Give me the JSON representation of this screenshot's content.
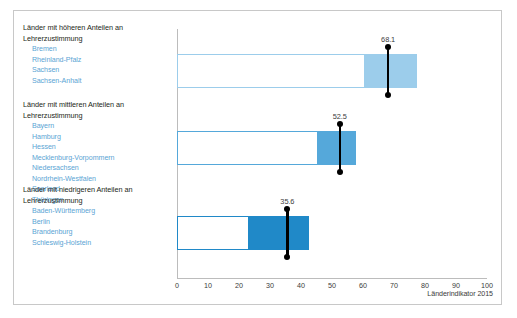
{
  "figure": {
    "source_note": "Länderindikator 2015"
  },
  "chart_data": {
    "type": "bar",
    "title": "",
    "xlabel": "",
    "ylabel": "",
    "xlim": [
      0,
      100
    ],
    "xticks": [
      0,
      10,
      20,
      30,
      40,
      50,
      60,
      70,
      80,
      90,
      100
    ],
    "xtick_labels": [
      "0",
      "10",
      "20",
      "30",
      "40",
      "50",
      "60",
      "70",
      "80",
      "90",
      "100"
    ],
    "grid": false,
    "legend": null,
    "orientation": "horizontal",
    "categories": [
      "Länder mit höheren Anteilen an Lehrerzustimmung",
      "Länder mit mittleren Anteilen an Lehrerzustimmung",
      "Länder mit niedrigeren Anteilen an Lehrerzustimmung"
    ],
    "series": [
      {
        "name": "Mittelwert",
        "values": [
          68.1,
          52.5,
          35.6
        ],
        "value_labels": [
          "68.1",
          "52.5",
          "35.6"
        ]
      },
      {
        "name": "Spannweite",
        "range_start": [
          60.5,
          45.6,
          23.2
        ],
        "range_end": [
          77.5,
          57.9,
          42.6
        ]
      }
    ],
    "bar_span_start": [
      0,
      0,
      0
    ],
    "colors": {
      "group_1_fill": "#9ccdeb",
      "group_1_outline": "#9ccdeb",
      "group_2_fill": "#55a8da",
      "group_2_outline": "#55a8da",
      "group_3_fill": "#2089c8",
      "group_3_outline": "#2089c8",
      "marker": "#000000",
      "axis": "#bcbcbc"
    }
  },
  "groups": [
    {
      "title_line_1": "Länder mit höheren Anteilen an",
      "title_line_2": "Lehrerzustimmung",
      "states": [
        "Bremen",
        "Rheinland-Pfalz",
        "Sachsen",
        "Sachsen-Anhalt"
      ]
    },
    {
      "title_line_1": "Länder mit mittleren Anteilen an",
      "title_line_2": "Lehrerzustimmung",
      "states": [
        "Bayern",
        "Hamburg",
        "Hessen",
        "Mecklenburg-Vorpommern",
        "Niedersachsen",
        "Nordrhein-Westfalen",
        "Saarland",
        "Thüringen"
      ]
    },
    {
      "title_line_1": "Länder mit niedrigeren Anteilen an",
      "title_line_2": "Lehrerzustimmung",
      "states": [
        "Baden-Württemberg",
        "Berlin",
        "Brandenburg",
        "Schleswig-Holstein"
      ]
    }
  ]
}
